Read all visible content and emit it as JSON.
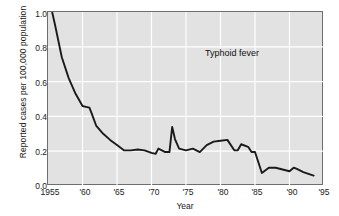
{
  "chart_data": {
    "type": "line",
    "title": "",
    "annotation": "Typhoid fever",
    "xlabel": "Year",
    "ylabel": "Reported cases per 100,000 population",
    "xlim": [
      1955,
      1995
    ],
    "ylim": [
      0.0,
      1.0
    ],
    "grid": true,
    "legend_position": "none",
    "xtick_labels": [
      "1955",
      "'60",
      "'65",
      "'70",
      "'75",
      "'80",
      "'85",
      "'90",
      "'95"
    ],
    "xtick_values": [
      1955,
      1960,
      1965,
      1970,
      1975,
      1980,
      1985,
      1990,
      1995
    ],
    "ytick_labels": [
      "0.0",
      "0.2",
      "0.4",
      "0.6",
      "0.8",
      "1.0"
    ],
    "ytick_values": [
      0.0,
      0.2,
      0.4,
      0.6,
      0.8,
      1.0
    ],
    "series": [
      {
        "name": "Typhoid fever",
        "color": "#1a1a1a",
        "x": [
          1955.6,
          1956,
          1957,
          1958,
          1959,
          1960,
          1960.5,
          1961,
          1961.3,
          1962,
          1963,
          1964,
          1965,
          1966,
          1967,
          1968,
          1969,
          1970,
          1970.6,
          1971,
          1972,
          1972.6,
          1973,
          1973.4,
          1974,
          1975,
          1976,
          1977,
          1978,
          1979,
          1980,
          1981,
          1982,
          1982.5,
          1983,
          1984,
          1984.5,
          1985,
          1985.5,
          1986,
          1987,
          1988,
          1989,
          1990,
          1990.6,
          1991,
          1992,
          1993.5
        ],
        "values": [
          1.0,
          0.93,
          0.74,
          0.62,
          0.53,
          0.46,
          0.455,
          0.45,
          0.42,
          0.345,
          0.3,
          0.265,
          0.235,
          0.205,
          0.205,
          0.21,
          0.205,
          0.19,
          0.185,
          0.215,
          0.195,
          0.195,
          0.34,
          0.27,
          0.215,
          0.205,
          0.215,
          0.195,
          0.235,
          0.255,
          0.26,
          0.265,
          0.205,
          0.205,
          0.24,
          0.225,
          0.195,
          0.195,
          0.135,
          0.075,
          0.105,
          0.105,
          0.095,
          0.085,
          0.105,
          0.1,
          0.08,
          0.06
        ]
      }
    ]
  },
  "axes": {
    "plot_background": "#e2e2e2",
    "gridline_color": "#ffffff",
    "frame_color": "#6e6e6e"
  }
}
